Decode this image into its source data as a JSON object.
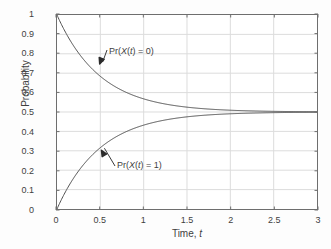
{
  "chart_data": {
    "type": "line",
    "title": "",
    "subtitle": "",
    "xlabel": "Time, t",
    "ylabel": "Probability",
    "xlim": [
      0,
      3
    ],
    "ylim": [
      0,
      1
    ],
    "xticks": [
      "0",
      "0.5",
      "1",
      "1.5",
      "2",
      "2.5",
      "3"
    ],
    "xtick_values": [
      0,
      0.5,
      1,
      1.5,
      2,
      2.5,
      3
    ],
    "yticks": [
      "0",
      "0.1",
      "0.2",
      "0.3",
      "0.4",
      "0.5",
      "0.6",
      "0.7",
      "0.8",
      "0.9",
      "1"
    ],
    "ytick_values": [
      0,
      0.1,
      0.2,
      0.3,
      0.4,
      0.5,
      0.6,
      0.7,
      0.8,
      0.9,
      1
    ],
    "grid": true,
    "legend": "none",
    "line_color": "#4d4d4d",
    "grid_color": "#dcdcdc",
    "axis_color": "#6e6e6e",
    "series": [
      {
        "name": "Pr(X(t) = 0)",
        "formula": "0.5 + 0.5*exp(-2t)",
        "x": [
          0,
          0.1,
          0.2,
          0.3,
          0.4,
          0.5,
          0.6,
          0.7,
          0.8,
          0.9,
          1,
          1.2,
          1.4,
          1.6,
          1.8,
          2,
          2.25,
          2.5,
          2.75,
          3
        ],
        "values": [
          1,
          0.909,
          0.835,
          0.774,
          0.725,
          0.684,
          0.651,
          0.623,
          0.601,
          0.583,
          0.568,
          0.545,
          0.53,
          0.52,
          0.514,
          0.509,
          0.506,
          0.503,
          0.502,
          0.501
        ]
      },
      {
        "name": "Pr(X(t) = 1)",
        "formula": "0.5 - 0.5*exp(-2t)",
        "x": [
          0,
          0.1,
          0.2,
          0.3,
          0.4,
          0.5,
          0.6,
          0.7,
          0.8,
          0.9,
          1,
          1.2,
          1.4,
          1.6,
          1.8,
          2,
          2.25,
          2.5,
          2.75,
          3
        ],
        "values": [
          0,
          0.091,
          0.165,
          0.226,
          0.275,
          0.316,
          0.349,
          0.377,
          0.399,
          0.417,
          0.432,
          0.455,
          0.47,
          0.48,
          0.486,
          0.491,
          0.494,
          0.497,
          0.498,
          0.499
        ]
      }
    ],
    "annotations": [
      {
        "text": "Pr(X(t) = 0)",
        "prefix": "Pr(",
        "italic1": "X",
        "mid": "(",
        "italic2": "t",
        "suffix": ") = 0)",
        "arrow_tip_x": 0.5,
        "arrow_tip_y": 0.745
      },
      {
        "text": "Pr(X(t) = 1)",
        "prefix": "Pr(",
        "italic1": "X",
        "mid": "(",
        "italic2": "t",
        "suffix": ") = 1)",
        "arrow_tip_x": 0.52,
        "arrow_tip_y": 0.305
      }
    ],
    "asymptote": 0.5
  },
  "axis": {
    "x_title_main": "Time, ",
    "x_title_italic": "t",
    "y_title": "Probability"
  }
}
